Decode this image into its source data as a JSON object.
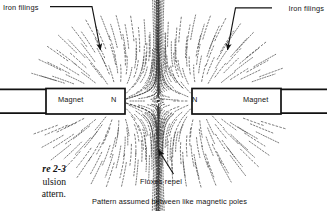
{
  "figure": {
    "caption_number": "re 2-3",
    "caption_line2": "ulsion",
    "caption_line3": "attern.",
    "bottom_caption": "Pattern assumed between like magnetic poles"
  },
  "annotations": {
    "iron_filings_left": "Iron filings",
    "iron_filings_right": "Iron filings",
    "fluxes_repel": "Fluxes repel"
  },
  "magnets": {
    "left": {
      "body_label": "Magnet",
      "pole_label": "N"
    },
    "right": {
      "pole_label": "N",
      "body_label": "Magnet"
    }
  },
  "colors": {
    "ink": "#141414",
    "background": "#ffffff",
    "filings": "#3a3a3a"
  },
  "chart_data": {
    "type": "diagram",
    "title": "Pattern assumed between like magnetic poles",
    "poles": [
      {
        "label": "N",
        "x": 118,
        "y": 101,
        "polarity": "north"
      },
      {
        "label": "N",
        "x": 199,
        "y": 101,
        "polarity": "north"
      }
    ],
    "neutral_point": {
      "x": 158,
      "y": 101
    },
    "magnet_bars": [
      {
        "x": 46,
        "y": 88,
        "width": 79,
        "height": 26,
        "label": "Magnet",
        "pole": "N"
      },
      {
        "x": 192,
        "y": 88,
        "width": 89,
        "height": 26,
        "label": "Magnet",
        "pole": "N"
      }
    ],
    "leader_lines": [
      {
        "label": "Iron filings",
        "from_x": 50,
        "from_y": 7,
        "elbow_x": 92,
        "elbow_y": 7,
        "to_x": 100,
        "to_y": 52
      },
      {
        "label": "Iron filings",
        "from_x": 272,
        "from_y": 8,
        "elbow_x": 236,
        "elbow_y": 8,
        "to_x": 228,
        "to_y": 52
      },
      {
        "label": "Fluxes repel",
        "from_x": 174,
        "from_y": 175,
        "to_x": 158,
        "to_y": 152
      }
    ]
  }
}
